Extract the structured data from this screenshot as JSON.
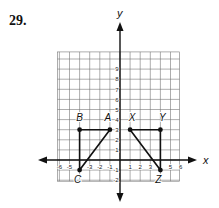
{
  "problem_number": "29.",
  "axes": {
    "x_label": "x",
    "y_label": "y"
  },
  "grid": {
    "xmin": -6,
    "xmax": 6,
    "ymin": -2,
    "ymax": 10
  },
  "x_ticks": [
    "-6",
    "-5",
    "-3",
    "-2",
    "-1",
    "1",
    "2",
    "3",
    "5",
    "6"
  ],
  "y_ticks": [
    "9",
    "8",
    "7",
    "6",
    "5",
    "4",
    "3",
    "2",
    "1",
    "-1",
    "-2"
  ],
  "triangles": [
    {
      "name": "ABC",
      "points": [
        {
          "label": "A",
          "x": -1,
          "y": 3
        },
        {
          "label": "B",
          "x": -4,
          "y": 3
        },
        {
          "label": "C",
          "x": -4,
          "y": -1
        }
      ]
    },
    {
      "name": "XYZ",
      "points": [
        {
          "label": "X",
          "x": 1,
          "y": 3
        },
        {
          "label": "Y",
          "x": 4,
          "y": 3
        },
        {
          "label": "Z",
          "x": 4,
          "y": -1
        }
      ]
    }
  ]
}
